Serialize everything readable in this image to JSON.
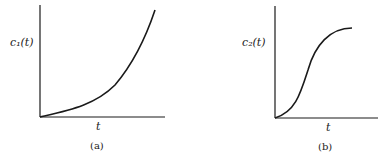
{
  "panels": [
    {
      "id": "a",
      "ylabel": "c₁(t)",
      "xlabel": "t",
      "caption": "(a)",
      "curve": "convex increasing (exponential-like)"
    },
    {
      "id": "b",
      "ylabel": "c₂(t)",
      "xlabel": "t",
      "caption": "(b)",
      "curve": "sigmoidal (S-shaped) saturating"
    }
  ],
  "colors": {
    "ink": "#1a1a1a",
    "background": "#ffffff"
  }
}
